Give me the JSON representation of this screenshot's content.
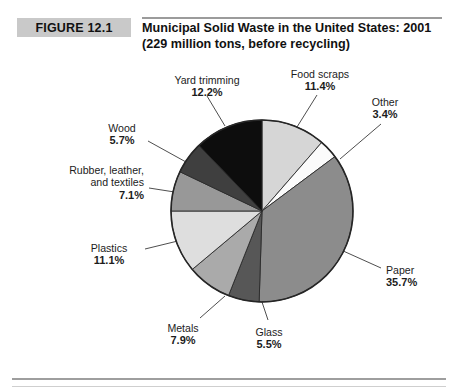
{
  "figure": {
    "badge_label": "FIGURE 12.1",
    "title_line1": "Municipal Solid Waste in the United States: 2001",
    "title_line2": "(229 million tons, before recycling)"
  },
  "chart_data": {
    "type": "pie",
    "title": "Municipal Solid Waste in the United States: 2001",
    "subtitle": "(229 million tons, before recycling)",
    "total_label": "229 million tons, before recycling",
    "units": "percent of total",
    "legend_position": "callout-labels",
    "grid": false,
    "start_angle_deg": 0,
    "direction": "clockwise",
    "categories": [
      "Food scraps",
      "Other",
      "Paper",
      "Glass",
      "Metals",
      "Plastics",
      "Rubber, leather, and textiles",
      "Wood",
      "Yard trimming"
    ],
    "values": [
      11.4,
      3.4,
      35.7,
      5.5,
      7.9,
      11.1,
      7.1,
      5.7,
      12.2
    ],
    "slices": [
      {
        "label": "Food scraps",
        "value": 11.4,
        "pct_text": "11.4%",
        "color": "#d6d6d6"
      },
      {
        "label": "Other",
        "value": 3.4,
        "pct_text": "3.4%",
        "color": "#fbfbfb"
      },
      {
        "label": "Paper",
        "value": 35.7,
        "pct_text": "35.7%",
        "color": "#8c8c8c"
      },
      {
        "label": "Glass",
        "value": 5.5,
        "pct_text": "5.5%",
        "color": "#575757"
      },
      {
        "label": "Metals",
        "value": 7.9,
        "pct_text": "7.9%",
        "color": "#aaaaaa"
      },
      {
        "label": "Plastics",
        "value": 11.1,
        "pct_text": "11.1%",
        "color": "#dedede"
      },
      {
        "label": "Rubber, leather, and textiles",
        "value": 7.1,
        "pct_text": "7.1%",
        "color": "#989898"
      },
      {
        "label": "Wood",
        "value": 5.7,
        "pct_text": "5.7%",
        "color": "#3f3f3f"
      },
      {
        "label": "Yard trimming",
        "value": 12.2,
        "pct_text": "12.2%",
        "color": "#0d0d0d"
      }
    ]
  },
  "labels": {
    "yard_trimming": {
      "name": "Yard trimming",
      "pct": "12.2%"
    },
    "food_scraps": {
      "name": "Food scraps",
      "pct": "11.4%"
    },
    "other": {
      "name": "Other",
      "pct": "3.4%"
    },
    "paper": {
      "name": "Paper",
      "pct": "35.7%"
    },
    "glass": {
      "name": "Glass",
      "pct": "5.5%"
    },
    "metals": {
      "name": "Metals",
      "pct": "7.9%"
    },
    "plastics": {
      "name": "Plastics",
      "pct": "11.1%"
    },
    "rubber": {
      "name_line1": "Rubber, leather,",
      "name_line2": "and textiles",
      "pct": "7.1%"
    },
    "wood": {
      "name": "Wood",
      "pct": "5.7%"
    }
  }
}
